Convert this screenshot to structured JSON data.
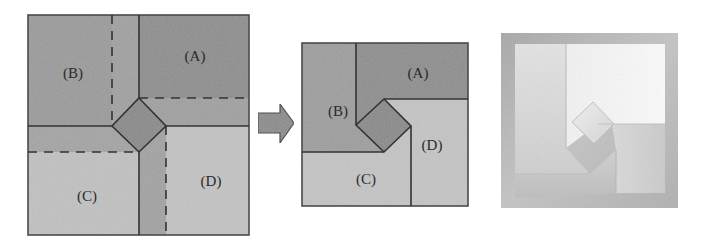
{
  "figure": {
    "panels": [
      {
        "id": "before",
        "description": "Crease pattern of a square sheet divided into four flaps around a central diamond",
        "labels": {
          "A": "(A)",
          "B": "(B)",
          "C": "(C)",
          "D": "(D)"
        },
        "line_styles": {
          "solid": "mountain/cut edge",
          "dashed": "fold line"
        }
      },
      {
        "id": "arrow",
        "description": "Block arrow pointing right indicating the transformation"
      },
      {
        "id": "after",
        "description": "Folded result with four flaps pinwheeled around a central diamond",
        "labels": {
          "A": "(A)",
          "B": "(B)",
          "C": "(C)",
          "D": "(D)"
        }
      },
      {
        "id": "photo",
        "description": "Photograph of the folded paper model"
      }
    ],
    "colors": {
      "region_dark": "#8e8e8e",
      "region_mid": "#9c9c9c",
      "region_strip": "#a3a3a3",
      "region_light": "#c2c2c2",
      "diamond": "#8a8a8a",
      "line": "#333333",
      "arrow_fill": "#8c8c8c"
    }
  }
}
